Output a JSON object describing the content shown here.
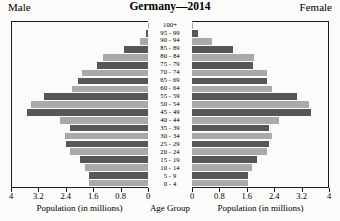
{
  "header": {
    "title": "Germany—2014",
    "male_label": "Male",
    "female_label": "Female"
  },
  "axis": {
    "male_caption": "Population (in millions)",
    "center_caption": "Age Group",
    "female_caption": "Population (in millions)",
    "male_ticks": [
      "4",
      "3.2",
      "2.4",
      "1.6",
      "0.8",
      "0"
    ],
    "female_ticks": [
      "0",
      "0.8",
      "1.6",
      "2.4",
      "3.2",
      "4"
    ]
  },
  "colors": {
    "bar_light": "#a9a9a9",
    "bar_dark": "#575757",
    "axis": "#1a1a1a",
    "background": "#fbfbf9"
  },
  "chart_data": {
    "type": "bar",
    "subtype": "population-pyramid",
    "title": "Germany—2014",
    "xlabel": "Population (in millions)",
    "ylabel": "Age Group",
    "xlim": [
      0,
      4
    ],
    "xticks": [
      0,
      0.8,
      1.6,
      2.4,
      3.2,
      4
    ],
    "grid": false,
    "legend": [
      "Male",
      "Female"
    ],
    "legend_position": "top-left and top-right",
    "categories": [
      "100+",
      "95 - 99",
      "90 - 94",
      "85 - 89",
      "80 - 84",
      "75 - 79",
      "70 - 74",
      "65 - 69",
      "60 - 64",
      "55 - 59",
      "50 - 54",
      "45 - 49",
      "40 - 44",
      "35 - 39",
      "30 - 34",
      "25 - 29",
      "20 - 24",
      "15 - 19",
      "10 - 14",
      "5 - 9",
      "0 - 4"
    ],
    "series": [
      {
        "name": "Male",
        "values": [
          0.01,
          0.06,
          0.24,
          0.72,
          1.32,
          1.5,
          1.95,
          2.05,
          2.25,
          3.05,
          3.45,
          3.55,
          2.6,
          2.3,
          2.45,
          2.4,
          2.3,
          2.0,
          1.85,
          1.75,
          1.75
        ]
      },
      {
        "name": "Female",
        "values": [
          0.03,
          0.18,
          0.58,
          1.22,
          1.82,
          1.78,
          2.2,
          2.2,
          2.35,
          3.1,
          3.45,
          3.5,
          2.55,
          2.25,
          2.35,
          2.25,
          2.2,
          1.9,
          1.75,
          1.65,
          1.65
        ]
      }
    ]
  }
}
